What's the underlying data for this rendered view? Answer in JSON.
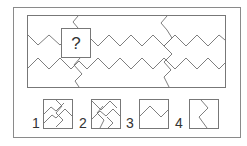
{
  "puzzle": {
    "question_mark": "?",
    "colors": {
      "line": "#6f6f6f",
      "frame": "#8a8a8a",
      "text": "#333333",
      "background": "#ffffff"
    }
  },
  "options": [
    {
      "label": "1",
      "description": "two crossing zigzag paths forming interlocking corners"
    },
    {
      "label": "2",
      "description": "two crossing zigzag paths with diagonal line"
    },
    {
      "label": "3",
      "description": "single horizontal zigzag line"
    },
    {
      "label": "4",
      "description": "single vertical zigzag line"
    }
  ]
}
